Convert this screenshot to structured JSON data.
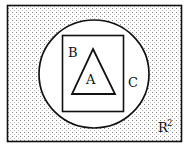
{
  "diagram": {
    "type": "nested-set-diagram",
    "background_color": "#ffffff",
    "stipple_color": "#8a8a8a",
    "stroke_color": "#111111",
    "fill_color": "#ffffff",
    "regions": [
      {
        "id": "plane",
        "shape": "rectangle",
        "label": "R",
        "superscript": "2",
        "filled": "stipple",
        "x": 7,
        "y": 5,
        "width": 175,
        "height": 137,
        "label_x": 160,
        "label_y": 132
      },
      {
        "id": "circle",
        "shape": "ellipse",
        "label": "C",
        "filled": "white",
        "cx": 94,
        "cy": 74,
        "rx": 55,
        "ry": 54,
        "label_x": 128,
        "label_y": 87
      },
      {
        "id": "rectangle",
        "shape": "rectangle",
        "label": "B",
        "filled": "white",
        "x": 62,
        "y": 35,
        "width": 62,
        "height": 77,
        "label_x": 68,
        "label_y": 57
      },
      {
        "id": "triangle",
        "shape": "triangle",
        "label": "A",
        "filled": "white",
        "points": "93,49 115,94 72,94",
        "label_x": 86,
        "label_y": 84
      }
    ]
  }
}
